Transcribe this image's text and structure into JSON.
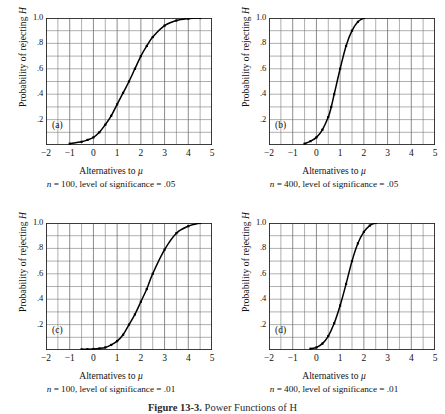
{
  "figure": {
    "caption_label": "Figure 13-3.",
    "caption_body": "Power Functions of H",
    "axis": {
      "xlabel_prefix": "Alternatives to ",
      "xlabel_symbol": "μ",
      "ylabel_prefix": "Probability of rejecting ",
      "ylabel_symbol": "H",
      "xticks": [
        "−2",
        "−1",
        "0",
        "1",
        "2",
        "3",
        "4",
        "5"
      ],
      "xtick_values": [
        -2,
        -1,
        0,
        1,
        2,
        3,
        4,
        5
      ],
      "yticks": [
        "1.0",
        ".8",
        ".6",
        ".4",
        ".2"
      ],
      "ytick_values": [
        1.0,
        0.8,
        0.6,
        0.4,
        0.2
      ]
    }
  },
  "panels": [
    {
      "tag": "(a)",
      "caption": "n = 100,  level of significance = .05",
      "caption_n": "n",
      "caption_rest": " = 100,  level of significance = .05"
    },
    {
      "tag": "(b)",
      "caption": "n = 400,  level of significance = .05",
      "caption_n": "n",
      "caption_rest": " = 400,  level of significance = .05"
    },
    {
      "tag": "(c)",
      "caption": "n = 100,  level of significance = .01",
      "caption_n": "n",
      "caption_rest": " = 100,  level of significance = .01"
    },
    {
      "tag": "(d)",
      "caption": "n = 400,  level of significance = .01",
      "caption_n": "n",
      "caption_rest": " = 400,  level of significance = .01"
    }
  ],
  "chart_data": [
    {
      "type": "line",
      "id": "panel-a",
      "title": "(a) n = 100, level of significance = .05",
      "xlabel": "Alternatives to μ",
      "ylabel": "Probability of rejecting H",
      "xlim": [
        -2,
        5
      ],
      "ylim": [
        0,
        1.0
      ],
      "grid": true,
      "x_major_step": 1,
      "x_minor_step": 0.5,
      "y_minor_step": 0.1,
      "markers": true,
      "x": [
        -1.0,
        -0.5,
        -0.25,
        0.0,
        0.25,
        0.5,
        0.75,
        1.0,
        1.25,
        1.5,
        1.75,
        2.0,
        2.25,
        2.5,
        3.0,
        3.5,
        4.0,
        4.5
      ],
      "y": [
        0.01,
        0.025,
        0.04,
        0.06,
        0.1,
        0.16,
        0.23,
        0.32,
        0.41,
        0.5,
        0.6,
        0.7,
        0.78,
        0.85,
        0.94,
        0.98,
        0.995,
        1.0
      ]
    },
    {
      "type": "line",
      "id": "panel-b",
      "title": "(b) n = 400, level of significance = .05",
      "xlabel": "Alternatives to μ",
      "ylabel": "Probability of rejecting H",
      "xlim": [
        -2,
        5
      ],
      "ylim": [
        0,
        1.0
      ],
      "grid": true,
      "x_major_step": 1,
      "x_minor_step": 0.5,
      "y_minor_step": 0.1,
      "markers": true,
      "x": [
        -0.5,
        -0.25,
        0.0,
        0.25,
        0.5,
        0.625,
        0.75,
        1.0,
        1.25,
        1.5,
        1.75,
        2.0
      ],
      "y": [
        0.01,
        0.03,
        0.06,
        0.12,
        0.22,
        0.3,
        0.4,
        0.6,
        0.78,
        0.9,
        0.97,
        1.0
      ]
    },
    {
      "type": "line",
      "id": "panel-c",
      "title": "(c) n = 100, level of significance = .01",
      "xlabel": "Alternatives to μ",
      "ylabel": "Probability of rejecting H",
      "xlim": [
        -2,
        5
      ],
      "ylim": [
        0,
        1.0
      ],
      "grid": true,
      "x_major_step": 1,
      "x_minor_step": 0.5,
      "y_minor_step": 0.1,
      "markers": true,
      "x": [
        -0.5,
        -0.25,
        0.0,
        0.25,
        0.5,
        0.75,
        1.0,
        1.25,
        1.5,
        1.75,
        2.0,
        2.25,
        2.5,
        3.0,
        3.5,
        4.0,
        4.5
      ],
      "y": [
        0.005,
        0.006,
        0.008,
        0.012,
        0.02,
        0.04,
        0.07,
        0.12,
        0.2,
        0.28,
        0.38,
        0.48,
        0.6,
        0.79,
        0.92,
        0.975,
        1.0
      ]
    },
    {
      "type": "line",
      "id": "panel-d",
      "title": "(d) n = 400, level of significance = .01",
      "xlabel": "Alternatives to μ",
      "ylabel": "Probability of rejecting H",
      "xlim": [
        -2,
        5
      ],
      "ylim": [
        0,
        1.0
      ],
      "grid": true,
      "x_major_step": 1,
      "x_minor_step": 0.5,
      "y_minor_step": 0.1,
      "markers": true,
      "x": [
        -0.25,
        0.0,
        0.25,
        0.5,
        0.75,
        1.0,
        1.25,
        1.5,
        1.75,
        2.0,
        2.25,
        2.5
      ],
      "y": [
        0.01,
        0.02,
        0.05,
        0.11,
        0.21,
        0.35,
        0.52,
        0.7,
        0.84,
        0.93,
        0.98,
        1.0
      ]
    }
  ],
  "colors": {
    "curve": "#000000",
    "grid": "#6e6e6e",
    "axis": "#222222",
    "text": "#111111"
  }
}
